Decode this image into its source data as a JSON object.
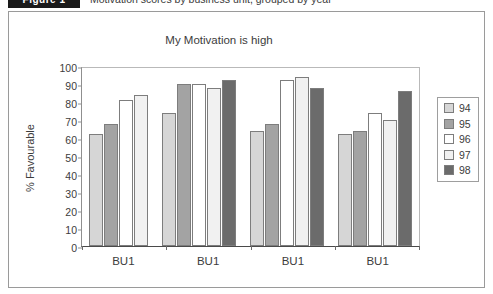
{
  "caption": {
    "tag_label": "Figure 1",
    "text": "Motivation scores by business unit, grouped by year"
  },
  "figure": {
    "y_axis_title": "% Favourable",
    "x_labels": [
      "BU1",
      "BU1",
      "BU1",
      "BU1"
    ]
  },
  "legend": {
    "entries": [
      {
        "label": "94",
        "color": "#d6d6d6"
      },
      {
        "label": "95",
        "color": "#a3a3a3"
      },
      {
        "label": "96",
        "color": "#ffffff"
      },
      {
        "label": "97",
        "color": "#f1f1f1"
      },
      {
        "label": "98",
        "color": "#6b6b6b"
      }
    ]
  },
  "chart_data": {
    "type": "bar",
    "title": "My Motivation is high",
    "xlabel": "",
    "ylabel": "% Favourable",
    "ylim": [
      0,
      100
    ],
    "ytick_labels": [
      "100",
      "90",
      "80",
      "70",
      "60",
      "50",
      "40",
      "30",
      "20",
      "10",
      "0"
    ],
    "yticks": [
      100,
      90,
      80,
      70,
      60,
      50,
      40,
      30,
      20,
      10,
      0
    ],
    "grid": false,
    "legend_position": "right",
    "categories": [
      "BU1",
      "BU1",
      "BU1",
      "BU1"
    ],
    "series": [
      {
        "name": "94",
        "color": "#d6d6d6",
        "values": [
          62,
          74,
          64,
          62
        ]
      },
      {
        "name": "95",
        "color": "#a3a3a3",
        "values": [
          68,
          90,
          68,
          64
        ]
      },
      {
        "name": "96",
        "color": "#ffffff",
        "values": [
          81,
          90,
          92,
          74
        ]
      },
      {
        "name": "97",
        "color": "#f1f1f1",
        "values": [
          84,
          88,
          94,
          70
        ]
      },
      {
        "name": "98",
        "color": "#6b6b6b",
        "values": [
          null,
          92,
          88,
          86
        ]
      }
    ]
  }
}
